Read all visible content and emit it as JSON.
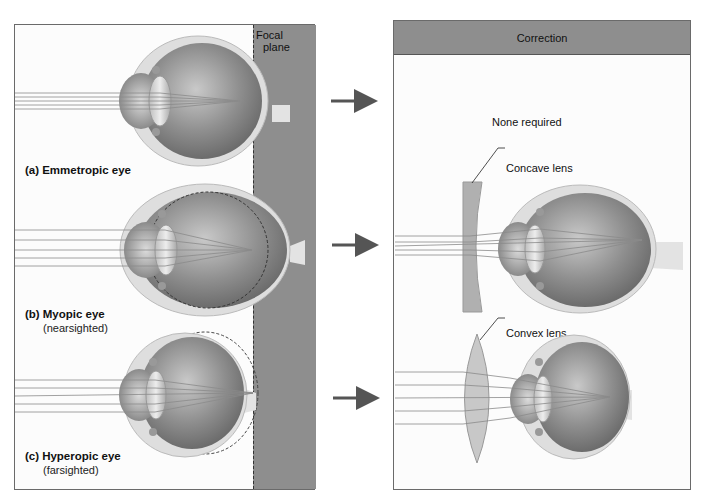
{
  "figure": {
    "left_panel": {
      "focal_plane_label_line1": "Focal",
      "focal_plane_label_line2": "plane",
      "cases": [
        {
          "letter": "(a)",
          "name": "Emmetropic eye",
          "note": ""
        },
        {
          "letter": "(b)",
          "name": "Myopic eye",
          "note": "(nearsighted)"
        },
        {
          "letter": "(c)",
          "name": "Hyperopic eye",
          "note": "(farsighted)"
        }
      ]
    },
    "right_panel": {
      "header": "Correction",
      "rows": [
        {
          "text": "None required"
        },
        {
          "lens_label": "Concave lens"
        },
        {
          "lens_label": "Convex lens"
        }
      ]
    },
    "colors": {
      "band_gray": "#8e8e8e",
      "arrow": "#555555",
      "eye_outer": "#d9d9d9",
      "eye_inner": "#8a8a8a",
      "panel_bg": "#fcfcfc"
    }
  }
}
